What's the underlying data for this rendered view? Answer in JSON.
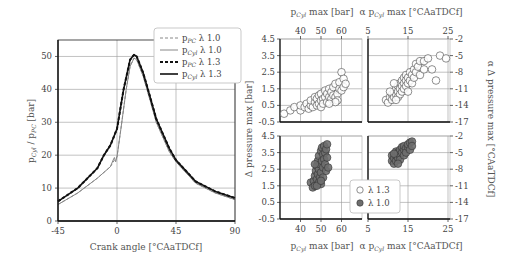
{
  "chart_data": [
    {
      "type": "line",
      "title": "",
      "xlabel": "Crank angle [°CAaTDCf]",
      "ylabel": "pCyl / pPC [bar]",
      "xlim": [
        -45,
        90
      ],
      "ylim": [
        0,
        55
      ],
      "xticks": [
        -45,
        0,
        45,
        90
      ],
      "yticks": [
        0,
        10,
        20,
        30,
        40,
        50
      ],
      "grid": true,
      "legend_position": "upper right",
      "series": [
        {
          "name": "pPC λ 1.0",
          "style": "dashed",
          "color": "#888888",
          "width": 1,
          "x": [
            -45,
            -30,
            -15,
            -5,
            -2,
            -1,
            0,
            3,
            7,
            10,
            13,
            15,
            20,
            25,
            30,
            40,
            45,
            60,
            75,
            90
          ],
          "y": [
            5,
            8.5,
            13,
            16.5,
            18.5,
            19,
            19.5,
            28,
            40,
            47,
            49.5,
            49,
            44,
            37,
            30,
            21,
            18,
            11.5,
            8.5,
            6.5
          ]
        },
        {
          "name": "pCyl λ 1.0",
          "style": "solid",
          "color": "#888888",
          "width": 1,
          "x": [
            -45,
            -30,
            -15,
            -5,
            -3,
            -2,
            -1,
            0,
            3,
            7,
            10,
            13,
            15,
            20,
            25,
            30,
            40,
            45,
            60,
            75,
            90
          ],
          "y": [
            5,
            8.5,
            13,
            16.5,
            18.5,
            19.3,
            18,
            19.5,
            28,
            40,
            47,
            49.5,
            49,
            44,
            37,
            30,
            21,
            18,
            11.5,
            8.5,
            6.5
          ]
        },
        {
          "name": "pPC λ 1.3",
          "style": "dashed",
          "color": "#111111",
          "width": 2,
          "x": [
            -45,
            -30,
            -15,
            -10,
            -5,
            0,
            5,
            10,
            13,
            15,
            20,
            25,
            30,
            40,
            45,
            60,
            75,
            90
          ],
          "y": [
            6,
            10,
            16,
            20,
            23,
            28,
            40,
            49,
            50.5,
            50,
            45,
            38,
            31,
            22,
            18.5,
            12,
            9,
            7
          ]
        },
        {
          "name": "pCyl λ 1.3",
          "style": "solid",
          "color": "#111111",
          "width": 1.6,
          "x": [
            -45,
            -30,
            -15,
            -10,
            -5,
            0,
            5,
            10,
            13,
            15,
            20,
            25,
            30,
            40,
            45,
            60,
            75,
            90
          ],
          "y": [
            6,
            10,
            16,
            20,
            23,
            28,
            40,
            49,
            50.5,
            50,
            45,
            38,
            31,
            22,
            18.5,
            12,
            9,
            7
          ]
        }
      ]
    },
    {
      "type": "scatter",
      "panel": "top-left",
      "xlabel": "pCyl max [bar]",
      "ylabel": "Δ pressure max [bar]",
      "xlim": [
        30,
        70
      ],
      "ylim": [
        -0.5,
        4.5
      ],
      "xticks": [
        40,
        50,
        60
      ],
      "yticks": [
        -0.5,
        0.5,
        1.5,
        2.5,
        3.5,
        4.5
      ],
      "series": [
        {
          "name": "λ 1.3",
          "marker": "open-circle",
          "points": [
            [
              32,
              0
            ],
            [
              35,
              0.2
            ],
            [
              37,
              0.4
            ],
            [
              40,
              0.2
            ],
            [
              40,
              0.5
            ],
            [
              42,
              0.4
            ],
            [
              43,
              0.6
            ],
            [
              44,
              0.3
            ],
            [
              45,
              0.5
            ],
            [
              45,
              0.8
            ],
            [
              46,
              0.4
            ],
            [
              47,
              0.7
            ],
            [
              47,
              1.0
            ],
            [
              48,
              0.5
            ],
            [
              48,
              0.9
            ],
            [
              49,
              0.6
            ],
            [
              49,
              1.1
            ],
            [
              50,
              0.8
            ],
            [
              50,
              1.2
            ],
            [
              50,
              0.4
            ],
            [
              51,
              0.9
            ],
            [
              51,
              0.6
            ],
            [
              52,
              1.0
            ],
            [
              52,
              1.4
            ],
            [
              53,
              0.7
            ],
            [
              53,
              1.2
            ],
            [
              54,
              1.0
            ],
            [
              54,
              1.5
            ],
            [
              55,
              0.9
            ],
            [
              55,
              1.3
            ],
            [
              56,
              1.1
            ],
            [
              56,
              1.6
            ],
            [
              57,
              1.0
            ],
            [
              57,
              1.8
            ],
            [
              58,
              1.2
            ],
            [
              58,
              0.8
            ],
            [
              59,
              1.5
            ],
            [
              59,
              1.9
            ],
            [
              60,
              1.4
            ],
            [
              60,
              2.5
            ],
            [
              61,
              2.1
            ],
            [
              61,
              1.6
            ],
            [
              62,
              1.8
            ],
            [
              57,
              0.7
            ],
            [
              54,
              0.6
            ]
          ]
        }
      ]
    },
    {
      "type": "scatter",
      "panel": "top-right",
      "xlabel": "α pCyl max [°CAaTDCf]",
      "ylabel": "α Δ pressure max [°CAaTDCf]",
      "xlim": [
        5,
        25.5
      ],
      "ylim": [
        -17,
        -2
      ],
      "xticks": [
        5,
        15,
        25
      ],
      "yticks": [
        -2,
        -5,
        -8,
        -11,
        -14,
        -17
      ],
      "series": [
        {
          "name": "λ 1.3",
          "marker": "open-circle",
          "points": [
            [
              9.5,
              -13
            ],
            [
              10,
              -13.5
            ],
            [
              10.5,
              -12.5
            ],
            [
              11,
              -12
            ],
            [
              11,
              -13
            ],
            [
              11.5,
              -11.5
            ],
            [
              11.5,
              -12.5
            ],
            [
              12,
              -11
            ],
            [
              12,
              -12
            ],
            [
              12.5,
              -10.5
            ],
            [
              12.5,
              -11.5
            ],
            [
              12.5,
              -12.5
            ],
            [
              13,
              -10
            ],
            [
              13,
              -11
            ],
            [
              13,
              -12
            ],
            [
              13.5,
              -9.5
            ],
            [
              13.5,
              -10.5
            ],
            [
              13.5,
              -11.5
            ],
            [
              14,
              -9
            ],
            [
              14,
              -10
            ],
            [
              14,
              -11
            ],
            [
              14.5,
              -8.5
            ],
            [
              14.5,
              -9.5
            ],
            [
              14.5,
              -10.5
            ],
            [
              15,
              -9
            ],
            [
              15,
              -10
            ],
            [
              15,
              -11.5
            ],
            [
              15.5,
              -8
            ],
            [
              15.5,
              -9.5
            ],
            [
              16,
              -8.5
            ],
            [
              16,
              -10
            ],
            [
              16.5,
              -7.5
            ],
            [
              16.5,
              -9
            ],
            [
              17,
              -6.5
            ],
            [
              17,
              -8
            ],
            [
              17.5,
              -7
            ],
            [
              18,
              -6
            ],
            [
              18,
              -8.5
            ],
            [
              19,
              -6
            ],
            [
              19,
              -7.5
            ],
            [
              20,
              -5.5
            ],
            [
              21,
              -7.5
            ],
            [
              22,
              -9.5
            ],
            [
              23,
              -5
            ],
            [
              24.5,
              -5.5
            ],
            [
              11.5,
              -10
            ],
            [
              12,
              -13
            ],
            [
              10.5,
              -11.5
            ]
          ]
        }
      ]
    },
    {
      "type": "scatter",
      "panel": "bottom-left",
      "xlabel": "pCyl max [bar]",
      "ylabel": "Δ pressure max [bar]",
      "xlim": [
        30,
        70
      ],
      "ylim": [
        -0.5,
        4.5
      ],
      "xticks": [
        40,
        50,
        60
      ],
      "yticks": [
        -0.5,
        0.5,
        1.5,
        2.5,
        3.5,
        4.5
      ],
      "series": [
        {
          "name": "λ 1.0",
          "marker": "filled-circle",
          "points": [
            [
              45,
              1.7
            ],
            [
              46,
              1.4
            ],
            [
              46.5,
              1.8
            ],
            [
              47,
              2.1
            ],
            [
              47,
              1.5
            ],
            [
              47.5,
              2.4
            ],
            [
              48,
              1.9
            ],
            [
              48,
              2.7
            ],
            [
              48.5,
              2.2
            ],
            [
              48.5,
              3.0
            ],
            [
              49,
              1.7
            ],
            [
              49,
              2.5
            ],
            [
              49,
              3.3
            ],
            [
              49.5,
              2.0
            ],
            [
              49.5,
              2.8
            ],
            [
              50,
              3.6
            ],
            [
              50,
              2.3
            ],
            [
              50,
              1.6
            ],
            [
              50.5,
              3.0
            ],
            [
              50.5,
              3.8
            ],
            [
              51,
              2.6
            ],
            [
              51,
              3.4
            ],
            [
              51,
              2.0
            ],
            [
              51.5,
              3.1
            ],
            [
              51.5,
              3.9
            ],
            [
              52,
              2.8
            ],
            [
              52,
              3.5
            ],
            [
              52.5,
              2.4
            ],
            [
              52.5,
              3.7
            ],
            [
              53,
              4.0
            ],
            [
              53,
              3.2
            ],
            [
              53.5,
              2.6
            ],
            [
              48,
              1.5
            ],
            [
              47,
              2.8
            ],
            [
              50,
              1.8
            ]
          ]
        }
      ]
    },
    {
      "type": "scatter",
      "panel": "bottom-right",
      "xlabel": "α pCyl max [°CAaTDCf]",
      "ylabel": "α Δ pressure max [°CAaTDCf]",
      "xlim": [
        5,
        25.5
      ],
      "ylim": [
        -17,
        -2
      ],
      "xticks": [
        5,
        15,
        25
      ],
      "yticks": [
        -2,
        -5,
        -8,
        -11,
        -14,
        -17
      ],
      "series": [
        {
          "name": "λ 1.0",
          "marker": "filled-circle",
          "points": [
            [
              11,
              -6.5
            ],
            [
              11,
              -5.5
            ],
            [
              11.5,
              -7
            ],
            [
              11.5,
              -6
            ],
            [
              12,
              -6.5
            ],
            [
              12,
              -5.5
            ],
            [
              12,
              -4.8
            ],
            [
              12.5,
              -6
            ],
            [
              12.5,
              -5
            ],
            [
              13,
              -5.5
            ],
            [
              13,
              -4.5
            ],
            [
              13,
              -6.3
            ],
            [
              13.5,
              -5
            ],
            [
              13.5,
              -4
            ],
            [
              14,
              -4.5
            ],
            [
              14,
              -5.5
            ],
            [
              14,
              -3.8
            ],
            [
              14.5,
              -4.2
            ],
            [
              14.5,
              -5
            ],
            [
              15,
              -4
            ],
            [
              15,
              -3.5
            ],
            [
              15.5,
              -3.2
            ],
            [
              15.5,
              -4.5
            ],
            [
              16,
              -3
            ],
            [
              16,
              -3.8
            ],
            [
              11.5,
              -5.2
            ],
            [
              12.5,
              -7
            ]
          ]
        }
      ]
    }
  ],
  "left_plot": {
    "xlabel": "Crank angle [°CAaTDCf]",
    "ylabel_main": "p",
    "ylabel_sub1": "Cyl",
    "ylabel_mid": " / p",
    "ylabel_sub2": "PC",
    "ylabel_tail": " [bar]",
    "xticks": [
      "-45",
      "0",
      "45",
      "90"
    ],
    "yticks": [
      "0",
      "10",
      "20",
      "30",
      "40",
      "50"
    ],
    "legend": [
      {
        "p": "p",
        "sub": "PC",
        "rest": " λ 1.0"
      },
      {
        "p": "p",
        "sub": "Cyl",
        "rest": " λ 1.0"
      },
      {
        "p": "p",
        "sub": "PC",
        "rest": " λ 1.3"
      },
      {
        "p": "p",
        "sub": "Cyl",
        "rest": " λ 1.3"
      }
    ]
  },
  "right_plots": {
    "top_xlabel_left": {
      "p": "p",
      "sub": "Cyl",
      "rest": " max [bar]"
    },
    "top_xlabel_right": {
      "pre": "α p",
      "sub": "Cyl",
      "rest": " max [°CAaTDCf]"
    },
    "bottom_xlabel_left": {
      "p": "p",
      "sub": "Cyl",
      "rest": " max [bar]"
    },
    "bottom_xlabel_right": {
      "pre": "α p",
      "sub": "Cyl",
      "rest": " max [°CAaTDCf]"
    },
    "left_ylabel": "Δ pressure max [bar]",
    "right_ylabel": "α Δ pressure max [°CAaTDCf]",
    "xticks_left": [
      "40",
      "50",
      "60"
    ],
    "xticks_right": [
      "5",
      "15",
      "25"
    ],
    "yticks_left": [
      "4.5",
      "3.5",
      "2.5",
      "1.5",
      "0.5",
      "-0.5"
    ],
    "yticks_right": [
      "-2",
      "-5",
      "-8",
      "-11",
      "-14",
      "-17"
    ],
    "legend": [
      {
        "label": "λ 1.3",
        "marker": "open-circle"
      },
      {
        "label": "λ 1.0",
        "marker": "filled-circle"
      }
    ]
  },
  "colors": {
    "open_marker_stroke": "#444444",
    "filled_marker": "#6e6e6e",
    "filled_marker_stroke": "#333333",
    "grid": "#999999",
    "axis": "#222222"
  }
}
